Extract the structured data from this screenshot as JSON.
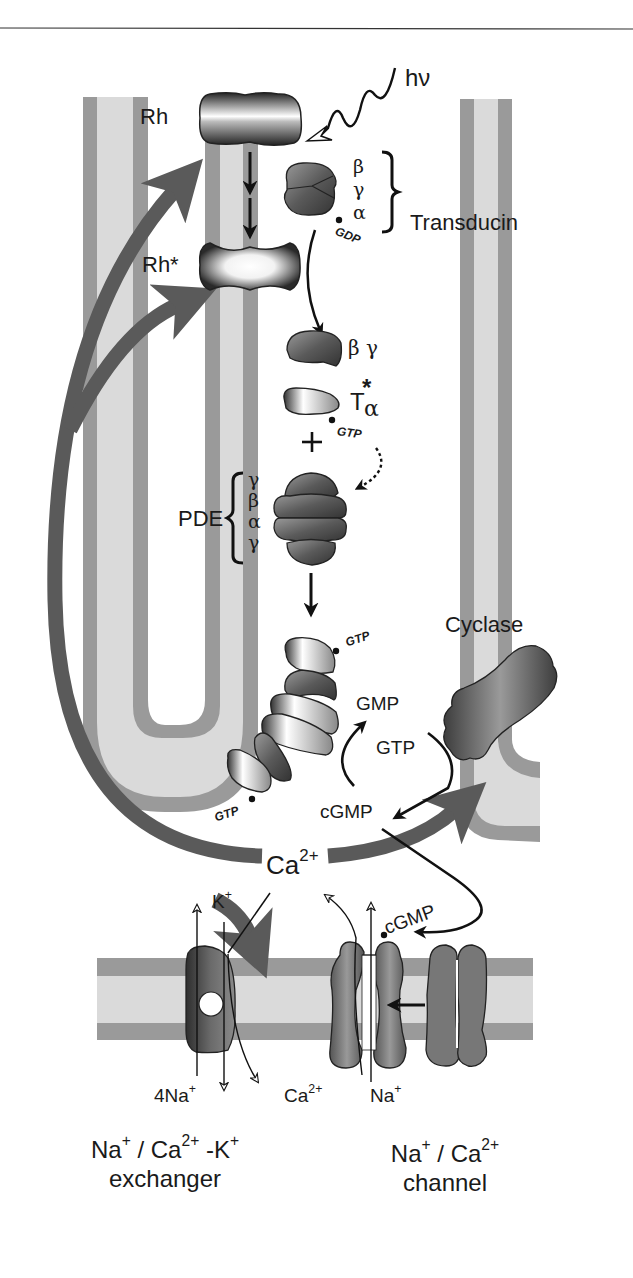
{
  "figure": {
    "colors": {
      "membrane_dark": "#9a9a9a",
      "membrane_light": "#d9d9d9",
      "feedback_arrow": "#5a5a5a",
      "protein_dark": "#3a3a3a",
      "text": "#1a1a1a"
    }
  },
  "labels": {
    "light": "hν",
    "rh": "Rh",
    "rh_active": "Rh*",
    "transducin": "Transducin",
    "transducin_subunits": [
      "β",
      "γ",
      "α"
    ],
    "gdp": "GDP",
    "beta_gamma": "β γ",
    "t_alpha_base": "T",
    "t_alpha_star": "*",
    "t_alpha_sub": "α",
    "gtp_1": "GTP",
    "plus": "+",
    "pde": "PDE",
    "pde_subunits": [
      "γ",
      "β",
      "α",
      "γ"
    ],
    "gtp_2": "GTP",
    "gtp_3": "GTP",
    "cyclase": "Cyclase",
    "gmp": "GMP",
    "gtp_substrate": "GTP",
    "cgmp": "cGMP",
    "ca_base": "Ca",
    "ca_sup": "2+",
    "k_base": "K",
    "k_sup": "+",
    "cgmp_bound": "cGMP",
    "na4_base": "4Na",
    "na4_sup": "+",
    "ca_in_base": "Ca",
    "ca_in_sup": "2+",
    "na_in_base": "Na",
    "na_in_sup": "+"
  },
  "captions": {
    "exchanger_line1_a": "Na",
    "exchanger_line1_a_sup": "+",
    "exchanger_line1_b": " / Ca",
    "exchanger_line1_b_sup": "2+",
    "exchanger_line1_c": " -K",
    "exchanger_line1_c_sup": "+",
    "exchanger_line2": "exchanger",
    "channel_line1_a": "Na",
    "channel_line1_a_sup": "+",
    "channel_line1_b": " / Ca",
    "channel_line1_b_sup": "2+",
    "channel_line2": "channel"
  }
}
